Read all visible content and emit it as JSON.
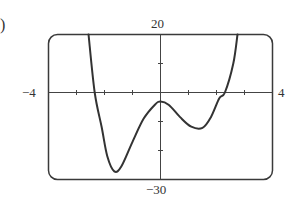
{
  "figure": {
    "part_marker": ")",
    "labels": {
      "ymax": "20",
      "ymin": "−30",
      "xmin": "−4",
      "xmax": "4"
    }
  },
  "chart_data": {
    "type": "line",
    "title": "",
    "xlabel": "",
    "ylabel": "",
    "xlim": [
      -4,
      4
    ],
    "ylim": [
      -30,
      20
    ],
    "x_ticks": [
      -3,
      -2,
      -1,
      1,
      2,
      3
    ],
    "y_ticks": [
      10,
      -10,
      -20
    ],
    "tick_labels": {
      "x": [
        "−4",
        "4"
      ],
      "y": [
        "20",
        "−30"
      ]
    },
    "grid": false,
    "legend": null,
    "frame": "rounded-rectangle viewing window",
    "series": [
      {
        "name": "f(x)",
        "description": "quartic-like curve with two local minima and one local maximum",
        "points": [
          [
            -2.57,
            20
          ],
          [
            -2.35,
            0
          ],
          [
            -2.1,
            -12
          ],
          [
            -1.9,
            -22
          ],
          [
            -1.65,
            -27.2
          ],
          [
            -1.4,
            -25.5
          ],
          [
            -1.0,
            -17
          ],
          [
            -0.6,
            -9
          ],
          [
            -0.2,
            -4.2
          ],
          [
            0.0,
            -3.1
          ],
          [
            0.3,
            -4.3
          ],
          [
            0.7,
            -8.5
          ],
          [
            1.1,
            -11.8
          ],
          [
            1.5,
            -12.2
          ],
          [
            1.8,
            -8.5
          ],
          [
            2.1,
            -2
          ],
          [
            2.3,
            0
          ],
          [
            2.6,
            10
          ],
          [
            2.75,
            20
          ]
        ],
        "key_points": {
          "x_intercepts": [
            -2.35,
            2.3
          ],
          "local_minima": [
            [
              -1.65,
              -27.2
            ],
            [
              1.5,
              -12.2
            ]
          ],
          "local_maximum": [
            0.0,
            -3.1
          ]
        },
        "color": "#333333"
      }
    ]
  }
}
